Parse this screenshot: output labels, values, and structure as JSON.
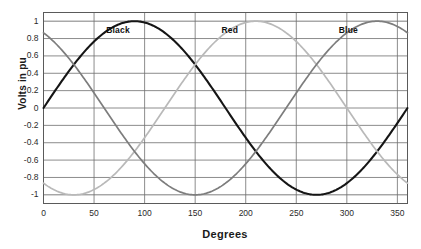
{
  "chart_data": {
    "type": "line",
    "title": "",
    "xlabel": "Degrees",
    "ylabel": "Volts in pu",
    "xlim": [
      0,
      360
    ],
    "ylim": [
      -1.1,
      1.1
    ],
    "grid": true,
    "legend_position": "in-plot-annotations",
    "xticks": [
      "0",
      "50",
      "100",
      "150",
      "200",
      "250",
      "300",
      "350"
    ],
    "xtick_values": [
      0,
      50,
      100,
      150,
      200,
      250,
      300,
      350
    ],
    "yticks": [
      "1",
      "0.8",
      "0.6",
      "0.4",
      "0.2",
      "0",
      "-0.2",
      "-0.4",
      "-0.6",
      "-0.8",
      "-1"
    ],
    "ytick_values": [
      1,
      0.8,
      0.6,
      0.4,
      0.2,
      0,
      -0.2,
      -0.4,
      -0.6,
      -0.8,
      -1
    ],
    "x": [
      0,
      10,
      20,
      30,
      40,
      50,
      60,
      70,
      80,
      90,
      100,
      110,
      120,
      130,
      140,
      150,
      160,
      170,
      180,
      190,
      200,
      210,
      220,
      230,
      240,
      250,
      260,
      270,
      280,
      290,
      300,
      310,
      320,
      330,
      340,
      350,
      360
    ],
    "series": [
      {
        "name": "Black",
        "color": "#151515",
        "width": 2.1,
        "phase_deg": 0,
        "amplitude": 1.0,
        "values": [
          0.0,
          0.17,
          0.34,
          0.5,
          0.64,
          0.77,
          0.87,
          0.94,
          0.98,
          1.0,
          0.98,
          0.94,
          0.87,
          0.77,
          0.64,
          0.5,
          0.34,
          0.17,
          0.0,
          -0.17,
          -0.34,
          -0.5,
          -0.64,
          -0.77,
          -0.87,
          -0.94,
          -0.98,
          -1.0,
          -0.98,
          -0.94,
          -0.87,
          -0.77,
          -0.64,
          -0.5,
          -0.34,
          -0.17,
          0.0
        ]
      },
      {
        "name": "Red",
        "color": "#b9b9b9",
        "width": 1.7,
        "phase_deg": -120,
        "amplitude": 1.0,
        "values": [
          -0.87,
          -0.94,
          -0.98,
          -1.0,
          -0.98,
          -0.94,
          -0.87,
          -0.77,
          -0.64,
          -0.5,
          -0.34,
          -0.17,
          0.0,
          0.17,
          0.34,
          0.5,
          0.64,
          0.77,
          0.87,
          0.94,
          0.98,
          1.0,
          0.98,
          0.94,
          0.87,
          0.77,
          0.64,
          0.5,
          0.34,
          0.17,
          0.0,
          -0.17,
          -0.34,
          -0.5,
          -0.64,
          -0.77,
          -0.87
        ]
      },
      {
        "name": "Blue",
        "color": "#7d7d7d",
        "width": 1.7,
        "phase_deg": 120,
        "amplitude": 1.0,
        "values": [
          0.87,
          0.77,
          0.64,
          0.5,
          0.34,
          0.17,
          0.0,
          -0.17,
          -0.34,
          -0.5,
          -0.64,
          -0.77,
          -0.87,
          -0.94,
          -0.98,
          -1.0,
          -0.98,
          -0.94,
          -0.87,
          -0.77,
          -0.64,
          -0.5,
          -0.34,
          -0.17,
          0.0,
          0.17,
          0.34,
          0.5,
          0.64,
          0.77,
          0.87,
          0.94,
          0.98,
          1.0,
          0.98,
          0.94,
          0.87
        ]
      }
    ],
    "annotations": [
      {
        "text": "Black",
        "x_deg": 62,
        "y_pu": 0.9
      },
      {
        "text": "Red",
        "x_deg": 176,
        "y_pu": 0.9
      },
      {
        "text": "Blue",
        "x_deg": 292,
        "y_pu": 0.9
      }
    ]
  }
}
